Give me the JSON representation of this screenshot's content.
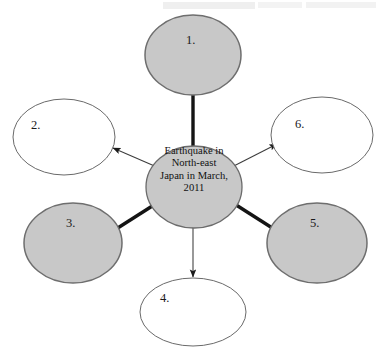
{
  "diagram": {
    "type": "radial-spider-diagram",
    "hub": {
      "name": "central-topic",
      "lines": [
        "Earthquake in",
        "North-east",
        "Japan in March,",
        "2011"
      ],
      "full_text": "Earthquake in North-east Japan in March, 2011",
      "fill": "#c8c8c8",
      "stroke": "#6b6b6b"
    },
    "colors": {
      "shaded_fill": "#c8c8c8",
      "shaded_stroke": "#6e6e6e",
      "blank_fill": "#ffffff",
      "blank_stroke": "#6a6a6a",
      "connector_thick": "#151515",
      "connector_thin": "#4a4a4a",
      "text": "#1a1a1a",
      "background": "#ffffff"
    },
    "nodes": [
      {
        "id": "node-1",
        "label": "1.",
        "position": "top",
        "style": "shaded",
        "connector": "thick-line",
        "arrow": false
      },
      {
        "id": "node-2",
        "label": "2.",
        "position": "upper-left",
        "style": "blank",
        "connector": "thin-arrow",
        "arrow": true
      },
      {
        "id": "node-3",
        "label": "3.",
        "position": "lower-left",
        "style": "shaded",
        "connector": "thick-line",
        "arrow": false
      },
      {
        "id": "node-4",
        "label": "4.",
        "position": "bottom",
        "style": "blank",
        "connector": "thin-arrow",
        "arrow": true
      },
      {
        "id": "node-5",
        "label": "5.",
        "position": "lower-right",
        "style": "shaded",
        "connector": "thick-line",
        "arrow": false
      },
      {
        "id": "node-6",
        "label": "6.",
        "position": "upper-right",
        "style": "blank",
        "connector": "thin-arrow",
        "arrow": true
      }
    ]
  }
}
